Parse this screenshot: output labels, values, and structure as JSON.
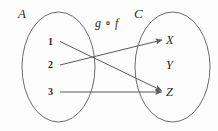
{
  "diagram": {
    "type": "function-composition-mapping",
    "composition_label": "g ∘ f",
    "sets": {
      "domain": {
        "name": "A",
        "elements": [
          {
            "label": "1",
            "x": 51,
            "y": 42
          },
          {
            "label": "2",
            "x": 51,
            "y": 65
          },
          {
            "label": "3",
            "x": 51,
            "y": 92
          }
        ]
      },
      "codomain": {
        "name": "C",
        "elements": [
          {
            "label": "X",
            "x": 170,
            "y": 41
          },
          {
            "label": "Y",
            "x": 170,
            "y": 66
          },
          {
            "label": "Z",
            "x": 170,
            "y": 93
          }
        ]
      }
    },
    "mappings": [
      {
        "from": "1",
        "to": "Z"
      },
      {
        "from": "2",
        "to": "X"
      },
      {
        "from": "3",
        "to": "Z"
      }
    ],
    "unmapped_codomain_elements": [
      "Y"
    ]
  },
  "colors": {
    "background": "#fdfdfd",
    "stroke": "#6a6a6a",
    "arrow": "#5a5a5a",
    "text": "#2b2b2b"
  }
}
